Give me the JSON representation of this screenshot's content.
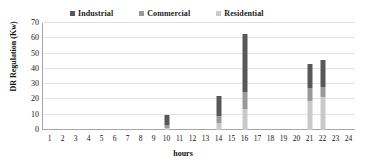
{
  "chart_data": {
    "type": "bar",
    "stacked": true,
    "title": "",
    "xlabel": "hours",
    "ylabel": "DR Regulation (Kw)",
    "categories": [
      "1",
      "2",
      "3",
      "4",
      "5",
      "6",
      "7",
      "8",
      "9",
      "10",
      "11",
      "12",
      "13",
      "14",
      "15",
      "16",
      "17",
      "18",
      "19",
      "20",
      "21",
      "22",
      "23",
      "24"
    ],
    "xlim": [
      1,
      24
    ],
    "ylim": [
      0,
      70
    ],
    "yticks": [
      0,
      10,
      20,
      30,
      40,
      50,
      60,
      70
    ],
    "grid": "horizontal",
    "legend_position": "top",
    "series": [
      {
        "name": "Residential",
        "color": "#c9c9c9",
        "values": [
          0,
          0,
          0,
          0,
          0,
          0,
          0,
          0,
          0,
          1.5,
          0,
          0,
          0,
          4.5,
          0,
          14,
          0,
          0,
          0,
          0,
          19,
          21.5,
          0,
          0
        ]
      },
      {
        "name": "Commercial",
        "color": "#9a9a9a",
        "values": [
          0,
          0,
          0,
          0,
          0,
          0,
          0,
          0,
          0,
          1.5,
          0,
          0,
          0,
          4.5,
          0,
          11,
          0,
          0,
          0,
          0,
          8.5,
          6.5,
          0,
          0
        ]
      },
      {
        "name": "Industrial",
        "color": "#585858",
        "values": [
          0,
          0,
          0,
          0,
          0,
          0,
          0,
          0,
          0,
          7,
          0,
          0,
          0,
          13,
          0,
          38,
          0,
          0,
          0,
          0,
          15.5,
          17.5,
          0,
          0
        ]
      }
    ],
    "totals": [
      0,
      0,
      0,
      0,
      0,
      0,
      0,
      0,
      0,
      10,
      0,
      0,
      0,
      22,
      0,
      63,
      0,
      0,
      0,
      0,
      43,
      45.5,
      0,
      0
    ]
  },
  "legend": {
    "entries": [
      {
        "label": "Industrial",
        "color": "#585858",
        "marker": "square-marker"
      },
      {
        "label": "Commercial",
        "color": "#9a9a9a",
        "marker": "square-marker"
      },
      {
        "label": "Residential",
        "color": "#c9c9c9",
        "marker": "square-marker"
      }
    ]
  },
  "axes": {
    "y_title": "DR Regulation (Kw)",
    "x_title": "hours"
  }
}
